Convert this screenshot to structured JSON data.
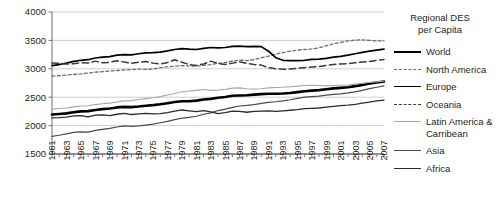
{
  "legend": {
    "title_line1": "Regional DES",
    "title_line2": "per Capita",
    "items": [
      {
        "key": "world",
        "label": "World",
        "style": "solid-thick",
        "color": "#000000"
      },
      {
        "key": "north_america",
        "label": "North America",
        "style": "dotted",
        "color": "#6d6d6d"
      },
      {
        "key": "europe",
        "label": "Europe",
        "style": "solid",
        "color": "#000000"
      },
      {
        "key": "oceania",
        "label": "Oceania",
        "style": "dashed",
        "color": "#3a3a3a"
      },
      {
        "key": "latin_america",
        "label": "Latin America &",
        "label2": "Carribean",
        "style": "solid-thin",
        "color": "#a6a6a6"
      },
      {
        "key": "asia",
        "label": "Asia",
        "style": "solid-thin",
        "color": "#4a4a4a"
      },
      {
        "key": "africa",
        "label": "Africa",
        "style": "solid-thin",
        "color": "#2b2b2b"
      }
    ]
  },
  "chart_data": {
    "type": "line",
    "title": "Regional DES per Capita",
    "xlabel": "",
    "ylabel": "",
    "ylim": [
      1500,
      4000
    ],
    "ytick_labels": [
      "1500",
      "2000",
      "2500",
      "3000",
      "3500",
      "4000"
    ],
    "yticks": [
      1500,
      2000,
      2500,
      3000,
      3500,
      4000
    ],
    "grid": true,
    "legend_position": "right",
    "x": [
      1961,
      1962,
      1963,
      1964,
      1965,
      1966,
      1967,
      1968,
      1969,
      1970,
      1971,
      1972,
      1973,
      1974,
      1975,
      1976,
      1977,
      1978,
      1979,
      1980,
      1981,
      1982,
      1983,
      1984,
      1985,
      1986,
      1987,
      1988,
      1989,
      1990,
      1991,
      1992,
      1993,
      1994,
      1995,
      1996,
      1997,
      1998,
      1999,
      2000,
      2001,
      2002,
      2003,
      2004,
      2005,
      2006,
      2007
    ],
    "xtick_labels": [
      "1961",
      "1963",
      "1965",
      "1967",
      "1969",
      "1971",
      "1973",
      "1975",
      "1977",
      "1979",
      "1981",
      "1983",
      "1985",
      "1987",
      "1989",
      "1991",
      "1993",
      "1995",
      "1997",
      "1999",
      "2001",
      "2003",
      "2005",
      "2007"
    ],
    "series": [
      {
        "name": "World",
        "color": "#000000",
        "style": "solid-thick",
        "width": 2.6,
        "values": [
          2195,
          2205,
          2215,
          2235,
          2250,
          2255,
          2275,
          2290,
          2300,
          2320,
          2330,
          2325,
          2335,
          2350,
          2360,
          2375,
          2395,
          2415,
          2430,
          2430,
          2440,
          2460,
          2470,
          2490,
          2505,
          2525,
          2530,
          2535,
          2545,
          2555,
          2560,
          2560,
          2565,
          2575,
          2590,
          2605,
          2615,
          2625,
          2640,
          2655,
          2665,
          2675,
          2695,
          2715,
          2740,
          2760,
          2775
        ]
      },
      {
        "name": "North America",
        "color": "#6d6d6d",
        "style": "dotted",
        "width": 1.3,
        "values": [
          2870,
          2880,
          2890,
          2900,
          2910,
          2925,
          2940,
          2950,
          2960,
          2970,
          2980,
          2985,
          2995,
          2990,
          2995,
          3020,
          3035,
          3045,
          3055,
          3050,
          3045,
          3060,
          3075,
          3095,
          3110,
          3135,
          3155,
          3145,
          3160,
          3195,
          3225,
          3260,
          3285,
          3310,
          3330,
          3340,
          3350,
          3370,
          3405,
          3440,
          3465,
          3490,
          3505,
          3510,
          3500,
          3490,
          3495
        ]
      },
      {
        "name": "Europe",
        "color": "#000000",
        "style": "solid",
        "width": 1.7,
        "values": [
          3055,
          3075,
          3100,
          3130,
          3150,
          3160,
          3190,
          3205,
          3215,
          3240,
          3250,
          3245,
          3265,
          3280,
          3285,
          3295,
          3315,
          3340,
          3355,
          3345,
          3340,
          3360,
          3375,
          3370,
          3375,
          3395,
          3400,
          3390,
          3395,
          3390,
          3310,
          3195,
          3150,
          3145,
          3145,
          3150,
          3165,
          3170,
          3185,
          3205,
          3220,
          3240,
          3265,
          3290,
          3310,
          3330,
          3345
        ]
      },
      {
        "name": "Oceania",
        "color": "#3a3a3a",
        "style": "dashed",
        "width": 1.5,
        "values": [
          3100,
          3095,
          3085,
          3090,
          3110,
          3100,
          3135,
          3105,
          3115,
          3140,
          3120,
          3095,
          3115,
          3130,
          3100,
          3085,
          3110,
          3160,
          3115,
          3075,
          3060,
          3085,
          3135,
          3095,
          3075,
          3100,
          3125,
          3095,
          3075,
          3065,
          3020,
          3000,
          2990,
          2995,
          3010,
          3020,
          3030,
          3040,
          3060,
          3075,
          3085,
          3090,
          3105,
          3120,
          3130,
          3150,
          3165
        ]
      },
      {
        "name": "Latin America & Carribean",
        "color": "#a6a6a6",
        "style": "solid-thin",
        "width": 1.1,
        "values": [
          2290,
          2300,
          2310,
          2330,
          2345,
          2350,
          2370,
          2385,
          2395,
          2415,
          2435,
          2440,
          2460,
          2475,
          2490,
          2510,
          2540,
          2565,
          2595,
          2610,
          2620,
          2635,
          2620,
          2625,
          2640,
          2660,
          2665,
          2650,
          2645,
          2650,
          2665,
          2670,
          2675,
          2685,
          2695,
          2705,
          2710,
          2705,
          2700,
          2705,
          2710,
          2715,
          2730,
          2745,
          2760,
          2770,
          2785
        ]
      },
      {
        "name": "Asia",
        "color": "#4a4a4a",
        "style": "solid-thin",
        "width": 1.2,
        "values": [
          1810,
          1830,
          1855,
          1880,
          1890,
          1885,
          1915,
          1935,
          1950,
          1975,
          1995,
          1985,
          1995,
          2010,
          2025,
          2050,
          2075,
          2105,
          2130,
          2145,
          2165,
          2200,
          2225,
          2265,
          2290,
          2320,
          2345,
          2355,
          2370,
          2390,
          2410,
          2420,
          2435,
          2455,
          2480,
          2500,
          2510,
          2520,
          2535,
          2550,
          2560,
          2575,
          2595,
          2620,
          2650,
          2675,
          2700
        ]
      },
      {
        "name": "Africa",
        "color": "#2b2b2b",
        "style": "solid-thin",
        "width": 1.3,
        "values": [
          2135,
          2140,
          2150,
          2170,
          2175,
          2155,
          2185,
          2190,
          2175,
          2200,
          2215,
          2195,
          2205,
          2215,
          2205,
          2210,
          2230,
          2255,
          2275,
          2260,
          2245,
          2265,
          2240,
          2210,
          2230,
          2255,
          2250,
          2235,
          2250,
          2255,
          2260,
          2250,
          2260,
          2270,
          2280,
          2300,
          2305,
          2310,
          2325,
          2340,
          2350,
          2360,
          2375,
          2395,
          2415,
          2435,
          2450
        ]
      }
    ]
  }
}
